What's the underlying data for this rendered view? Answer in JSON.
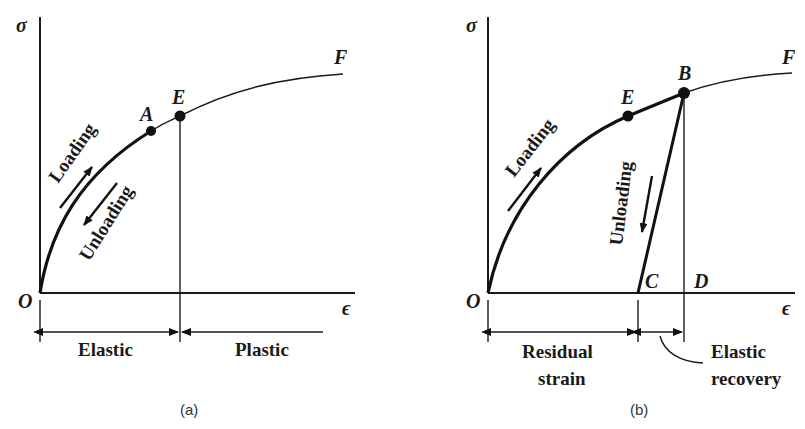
{
  "panels": [
    {
      "id": "a",
      "caption": "(a)",
      "y_axis_label": "σ",
      "x_axis_label": "ϵ",
      "origin_label": "O",
      "points": {
        "A": "A",
        "E": "E",
        "F": "F"
      },
      "arrows": {
        "loading": "Loading",
        "unloading": "Unloading"
      },
      "regions": {
        "elastic": "Elastic",
        "plastic": "Plastic"
      }
    },
    {
      "id": "b",
      "caption": "(b)",
      "y_axis_label": "σ",
      "x_axis_label": "ϵ",
      "origin_label": "O",
      "points": {
        "E": "E",
        "B": "B",
        "F": "F",
        "C": "C",
        "D": "D"
      },
      "arrows": {
        "loading": "Loading",
        "unloading": "Unloading"
      },
      "regions": {
        "residual_line1": "Residual",
        "residual_line2": "strain",
        "recovery_line1": "Elastic",
        "recovery_line2": "recovery"
      }
    }
  ]
}
